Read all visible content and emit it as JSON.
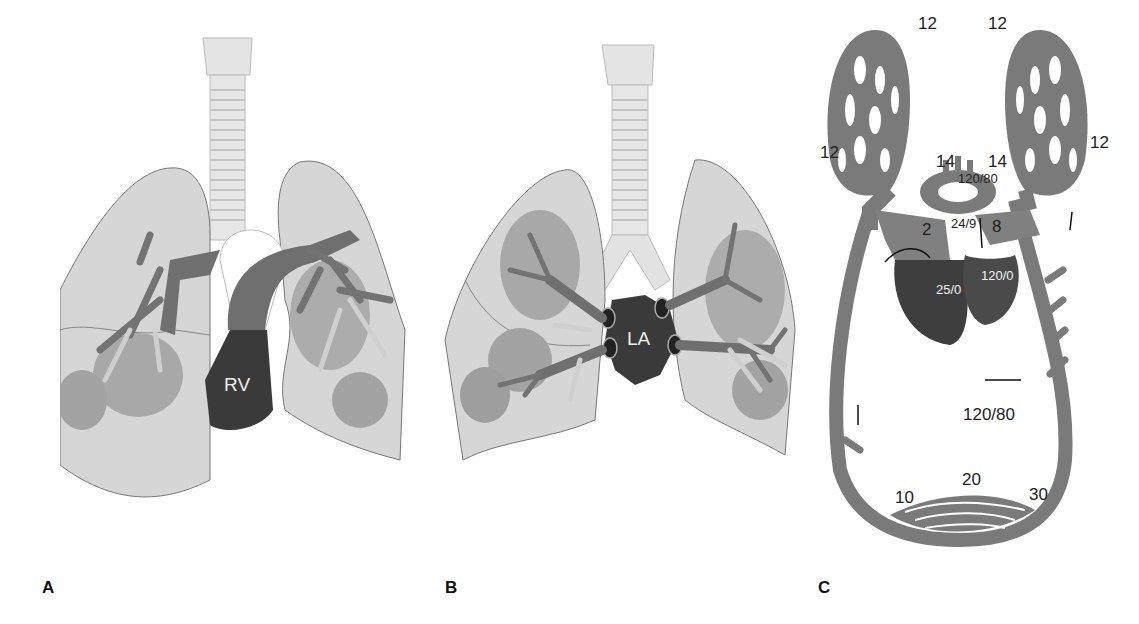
{
  "figure": {
    "panels": [
      {
        "id": "A",
        "label": "A",
        "chamber_label": "RV",
        "description": "Pulmonary arterial tree arising from right ventricle"
      },
      {
        "id": "B",
        "label": "B",
        "chamber_label": "LA",
        "description": "Pulmonary veins draining into left atrium"
      },
      {
        "id": "C",
        "label": "C",
        "description": "Circulation pressure diagram (mmHg)"
      }
    ],
    "panel_c": {
      "pulmonary_capillary_pressures": {
        "top_left": "12",
        "top_right": "12",
        "left": "12",
        "right": "12"
      },
      "pulmonary_artery_branches": {
        "left": "14",
        "right": "14"
      },
      "aorta": "120/80",
      "pulmonary_artery": "24/9",
      "right_atrium": "2",
      "left_atrium": "8",
      "right_ventricle": "25/0",
      "left_ventricle": "120/0",
      "systemic_artery": "120/80",
      "systemic_capillaries": {
        "venous_end": "10",
        "middle": "20",
        "arterial_end": "30"
      }
    },
    "colors": {
      "lung_fill": "#d6d6d6",
      "lobe_shade": "#a9a9a9",
      "vessel": "#6f6f6f",
      "chamber_dark": "#3a3a3a",
      "trachea": "#e2e2e2",
      "circuit": "#7a7a7a"
    }
  }
}
